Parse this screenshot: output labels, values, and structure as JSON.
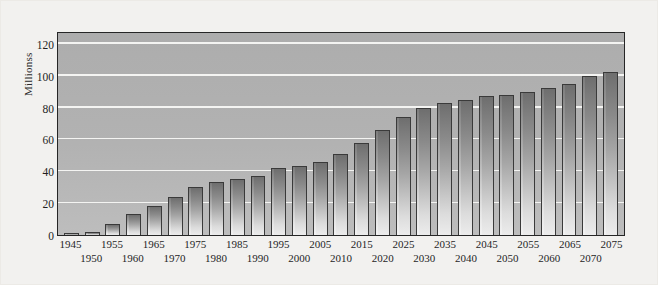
{
  "chart_data": {
    "type": "bar",
    "title": "",
    "xlabel": "",
    "ylabel": "Millionss",
    "ylim": [
      0,
      128
    ],
    "yticks": [
      0,
      20,
      40,
      60,
      80,
      100,
      120
    ],
    "ytick_labels": [
      "0",
      "20",
      "40",
      "60",
      "80",
      "100",
      "120"
    ],
    "grid": true,
    "gridlines_at": [
      20,
      40,
      60,
      80,
      100,
      120
    ],
    "legend": null,
    "categories": [
      "1945",
      "1950",
      "1955",
      "1960",
      "1965",
      "1970",
      "1975",
      "1980",
      "1985",
      "1990",
      "1995",
      "2000",
      "2005",
      "2010",
      "2015",
      "2020",
      "2025",
      "2030",
      "2035",
      "2040",
      "2045",
      "2050",
      "2055",
      "2060",
      "2065",
      "2070",
      "2075"
    ],
    "values": [
      1,
      2,
      7,
      13,
      18,
      24,
      30,
      33,
      35,
      37,
      42,
      43,
      46,
      51,
      58,
      66,
      74,
      80,
      83,
      85,
      87,
      88,
      90,
      92,
      95,
      100,
      102
    ],
    "bar_color_top": "#6e6e6e",
    "bar_color_bottom": "#ececec",
    "plot_background": "#b2b2b2",
    "gridline_color": "#f4f4f2",
    "axis_color": "#262626",
    "figure_background": "#f2f1ef"
  }
}
